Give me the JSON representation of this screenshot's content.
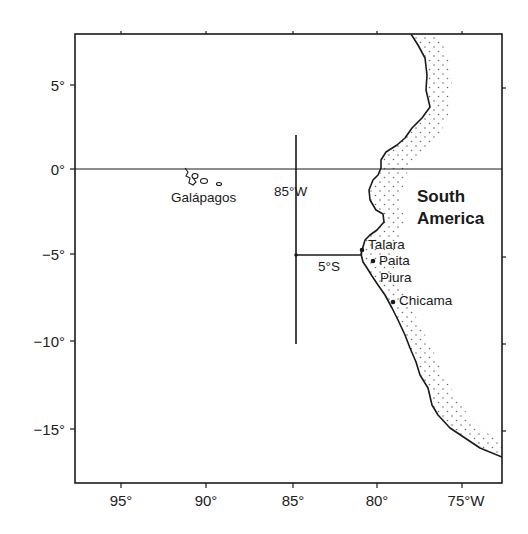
{
  "map": {
    "frame": {
      "lon_min": -97.5,
      "lon_max": -72.5,
      "lat_min": -18,
      "lat_max": 8
    },
    "x_axis": {
      "ticks": [
        {
          "lon": -95,
          "label": "95°"
        },
        {
          "lon": -90,
          "label": "90°"
        },
        {
          "lon": -85,
          "label": "85°"
        },
        {
          "lon": -80,
          "label": "80°"
        },
        {
          "lon": -75,
          "label": "75°W"
        }
      ]
    },
    "y_axis": {
      "ticks": [
        {
          "lat": 5,
          "label": "5°"
        },
        {
          "lat": 0,
          "label": "0°"
        },
        {
          "lat": -5,
          "label": "−5°"
        },
        {
          "lat": -10,
          "label": "−10°"
        },
        {
          "lat": -15,
          "label": "−15°"
        }
      ]
    },
    "equator_line": {
      "lat": 0
    },
    "crosshair": {
      "vertical": {
        "lon": -85,
        "lat_from": 2,
        "lat_to": -10,
        "label": "85°W"
      },
      "horizontal": {
        "lat": -5,
        "lon_from": -85,
        "lon_to": -81.2,
        "label": "5°S"
      }
    },
    "region_label": {
      "line1": "South",
      "line2": "America"
    },
    "islands_label": "Galápagos",
    "places": [
      {
        "name": "Talara",
        "lon": -81.3,
        "lat": -4.6
      },
      {
        "name": "Paita",
        "lon": -81.1,
        "lat": -5.1
      },
      {
        "name": "Piura",
        "lon": -80.6,
        "lat": -5.2
      },
      {
        "name": "Chicama",
        "lon": -79.2,
        "lat": -7.8
      }
    ],
    "colors": {
      "ink": "#1a1a1a",
      "background": "#ffffff",
      "land_stipple": "#555555"
    }
  }
}
